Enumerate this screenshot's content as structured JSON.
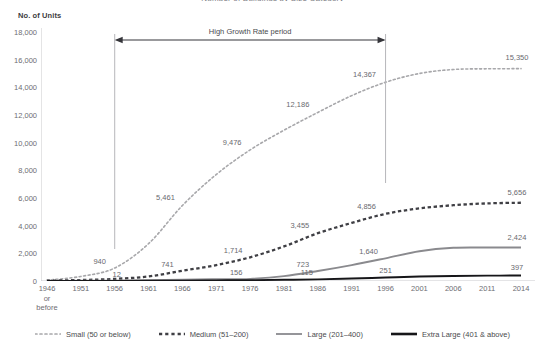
{
  "chart_title": "Number of Buildings by Size Category",
  "y_axis_title": "No. of Units",
  "annotation": {
    "label": "High Growth Rate period",
    "start_year": "1956",
    "end_year": "1996"
  },
  "legend": {
    "items": [
      {
        "label": "Small (50 or below)",
        "key": "small",
        "color": "#a8a8ab",
        "style": "fine-dash"
      },
      {
        "label": "Medium (51–200)",
        "key": "medium",
        "color": "#3f3f44",
        "style": "bold-dash"
      },
      {
        "label": "Large (201–400)",
        "key": "large",
        "color": "#8a8a8e",
        "style": "solid"
      },
      {
        "label": "Extra Large (401 & above)",
        "key": "xlarge",
        "color": "#161619",
        "style": "solid-bold"
      }
    ]
  },
  "chart_data": {
    "type": "line",
    "title": "Number of Buildings by Size Category",
    "xlabel": "",
    "ylabel": "No. of Units",
    "ylim": [
      0,
      18000
    ],
    "ytick_values": [
      0,
      2000,
      4000,
      6000,
      8000,
      10000,
      12000,
      14000,
      16000,
      18000
    ],
    "ytick_labels": [
      "0",
      "2,000",
      "4,000",
      "6,000",
      "8,000",
      "10,000",
      "12,000",
      "14,000",
      "16,000",
      "18,000"
    ],
    "grid": false,
    "legend_position": "bottom",
    "categories": [
      "1946 or before",
      "1951",
      "1956",
      "1961",
      "1966",
      "1971",
      "1976",
      "1981",
      "1986",
      "1991",
      "1996",
      "2001",
      "2006",
      "2011",
      "2014"
    ],
    "xtick_labels": [
      "1946\nor\nbefore",
      "1951",
      "1956",
      "1961",
      "1966",
      "1971",
      "1976",
      "1981",
      "1986",
      "1991",
      "1996",
      "2001",
      "2006",
      "2011",
      "2014"
    ],
    "series": [
      {
        "name": "Small (50 or below)",
        "color": "#a8a8ab",
        "values": [
          60,
          330,
          940,
          2700,
          5461,
          7700,
          9476,
          10900,
          12186,
          13400,
          14367,
          15000,
          15290,
          15340,
          15350
        ],
        "labels": [
          {
            "category": "1956",
            "value": 940,
            "text": "940"
          },
          {
            "category": "1966",
            "value": 5461,
            "text": "5,461"
          },
          {
            "category": "1976",
            "value": 9476,
            "text": "9,476"
          },
          {
            "category": "1986",
            "value": 12186,
            "text": "12,186"
          },
          {
            "category": "1996",
            "value": 14367,
            "text": "14,367"
          },
          {
            "category": "2014",
            "value": 15350,
            "text": "15,350"
          }
        ]
      },
      {
        "name": "Medium (51–200)",
        "color": "#3f3f44",
        "values": [
          20,
          70,
          150,
          330,
          741,
          1150,
          1714,
          2500,
          3455,
          4200,
          4856,
          5250,
          5480,
          5610,
          5656
        ],
        "labels": [
          {
            "category": "1966",
            "value": 741,
            "text": "741"
          },
          {
            "category": "1976",
            "value": 1714,
            "text": "1,714"
          },
          {
            "category": "1986",
            "value": 3455,
            "text": "3,455"
          },
          {
            "category": "1996",
            "value": 4856,
            "text": "4,856"
          },
          {
            "category": "2014",
            "value": 5656,
            "text": "5,656"
          }
        ]
      },
      {
        "name": "Large (201–400)",
        "color": "#8a8a8e",
        "values": [
          5,
          15,
          30,
          60,
          100,
          130,
          156,
          350,
          723,
          1150,
          1640,
          2150,
          2400,
          2420,
          2424
        ],
        "labels": [
          {
            "category": "1976",
            "value": 156,
            "text": "156"
          },
          {
            "category": "1986",
            "value": 723,
            "text": "723"
          },
          {
            "category": "1996",
            "value": 1640,
            "text": "1,640"
          },
          {
            "category": "2014",
            "value": 2424,
            "text": "2,424"
          }
        ]
      },
      {
        "name": "Extra Large (401 & above)",
        "color": "#161619",
        "values": [
          2,
          5,
          12,
          20,
          30,
          45,
          60,
          85,
          115,
          180,
          251,
          320,
          360,
          385,
          397
        ],
        "labels": [
          {
            "category": "1956",
            "value": 12,
            "text": "12"
          },
          {
            "category": "1986",
            "value": 115,
            "text": "115"
          },
          {
            "category": "1996",
            "value": 251,
            "text": "251"
          },
          {
            "category": "2014",
            "value": 397,
            "text": "397"
          }
        ]
      }
    ]
  }
}
